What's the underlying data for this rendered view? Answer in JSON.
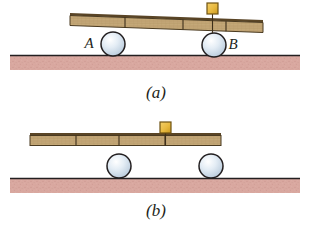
{
  "figure": {
    "panels": [
      {
        "id": "a",
        "caption": "(a)",
        "caption_x": 156,
        "caption_y": 98,
        "plank": {
          "label": "wooden plank",
          "fill": "#c4a878",
          "edge": "#6b5435",
          "top_edge": "#5a4526",
          "left_x": 70,
          "right_x": 263,
          "left_y": 14,
          "right_y": 21,
          "thickness": 10,
          "segment_divider_x": [
            125,
            183,
            226
          ]
        },
        "ground": {
          "label": "ground",
          "fill": "#d9a8a0",
          "line_color": "#231f20",
          "left_x": 10,
          "right_x": 300,
          "top_y": 55,
          "bottom_y": 70
        },
        "spheres": [
          {
            "label": "A",
            "name": "sphere-a",
            "cx": 113,
            "cy": 44,
            "r": 12,
            "fill": "#d8e3ee",
            "stroke": "#231f20",
            "label_x": 89,
            "label_y": 48
          },
          {
            "label": "B",
            "name": "sphere-b",
            "cx": 214,
            "cy": 45,
            "r": 12,
            "fill": "#d8e3ee",
            "stroke": "#231f20",
            "label_x": 230,
            "label_y": 49
          }
        ],
        "block": {
          "label": "small block",
          "fill": "#e8b93f",
          "stroke": "#8a6a18",
          "x": 207,
          "y": 3,
          "w": 11,
          "h": 11
        }
      },
      {
        "id": "b",
        "caption": "(b)",
        "caption_x": 156,
        "caption_y": 216,
        "plank": {
          "label": "wooden plank",
          "fill": "#c4a878",
          "edge": "#6b5435",
          "top_edge": "#5a4526",
          "left_x": 30,
          "right_x": 221,
          "left_y": 133,
          "right_y": 133,
          "thickness": 10,
          "segment_divider_x": [
            76,
            119,
            165
          ]
        },
        "ground": {
          "label": "ground",
          "fill": "#d9a8a0",
          "line_color": "#231f20",
          "left_x": 10,
          "right_x": 300,
          "top_y": 178,
          "bottom_y": 193
        },
        "spheres": [
          {
            "label": "",
            "name": "sphere-left",
            "cx": 119,
            "cy": 166,
            "r": 12,
            "fill": "#d8e3ee",
            "stroke": "#231f20",
            "label_x": 0,
            "label_y": 0
          },
          {
            "label": "",
            "name": "sphere-right",
            "cx": 211,
            "cy": 166,
            "r": 12,
            "fill": "#d8e3ee",
            "stroke": "#231f20",
            "label_x": 0,
            "label_y": 0
          }
        ],
        "block": {
          "label": "small block",
          "fill": "#e8b93f",
          "stroke": "#8a6a18",
          "x": 160,
          "y": 122,
          "w": 11,
          "h": 11
        }
      }
    ],
    "colors": {
      "plank_fill": "#c4a878",
      "plank_edge": "#6b5435",
      "ground_fill": "#d9a8a0",
      "sphere_fill": "#d8e3ee",
      "block_fill": "#e8b93f",
      "ink": "#231f20"
    }
  }
}
